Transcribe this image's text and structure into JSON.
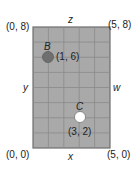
{
  "diagram": {
    "grid": {
      "cols": 5,
      "rows": 8,
      "fill": "#a9a9a9",
      "line": "#8a8a8a",
      "border": "#6e6e6e"
    },
    "corners": {
      "top_left": "(0, 8)",
      "top_right": "(5, 8)",
      "bottom_left": "(0, 0)",
      "bottom_right": "(5, 0)"
    },
    "sides": {
      "top": "z",
      "bottom": "x",
      "left": "y",
      "right": "w"
    },
    "points": [
      {
        "name": "B",
        "coords": "(1, 6)",
        "x": 1,
        "y": 6,
        "color": "#6f6f6f"
      },
      {
        "name": "C",
        "coords": "(3, 2)",
        "x": 3,
        "y": 2,
        "color": "#ffffff"
      }
    ]
  }
}
